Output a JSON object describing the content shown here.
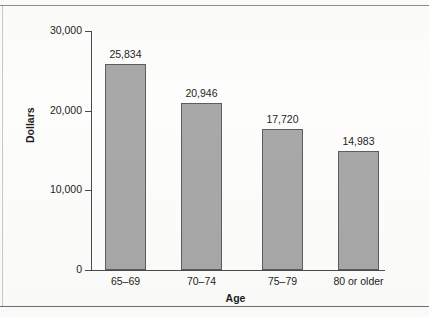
{
  "chart_data": {
    "type": "bar",
    "title": "",
    "xlabel": "Age",
    "ylabel": "Dollars",
    "categories": [
      "65–69",
      "70–74",
      "75–79",
      "80 or older"
    ],
    "values": [
      25834,
      20946,
      17720,
      14983
    ],
    "value_labels": [
      "25,834",
      "20,946",
      "17,720",
      "14,983"
    ],
    "ylim": [
      0,
      30000
    ],
    "ytick_values": [
      0,
      10000,
      20000,
      30000
    ],
    "ytick_labels": [
      "0",
      "10,000",
      "20,000",
      "30,000"
    ],
    "grid": false,
    "legend": null,
    "bar_color": "#a8a8a8",
    "bar_edge_color": "#5d5d5d",
    "text_color": "#1d1d1d",
    "background_color": "#fdfdfc"
  }
}
